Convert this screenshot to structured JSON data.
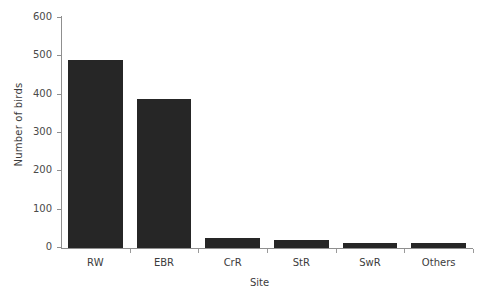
{
  "chart_data": {
    "type": "bar",
    "title": "",
    "xlabel": "Site",
    "ylabel": "Number of birds",
    "categories": [
      "RW",
      "EBR",
      "CrR",
      "StR",
      "SwR",
      "Others"
    ],
    "values": [
      490,
      390,
      25,
      22,
      12,
      13
    ],
    "ylim": [
      0,
      600
    ],
    "yticks": [
      0,
      100,
      200,
      300,
      400,
      500,
      600
    ],
    "ytick_labels": [
      "0",
      "100",
      "200",
      "300",
      "400",
      "500",
      "600"
    ],
    "grid": false,
    "legend": false,
    "bar_color": "#262626",
    "axis_color": "#8f8f8f",
    "background_color": "#ffffff"
  }
}
